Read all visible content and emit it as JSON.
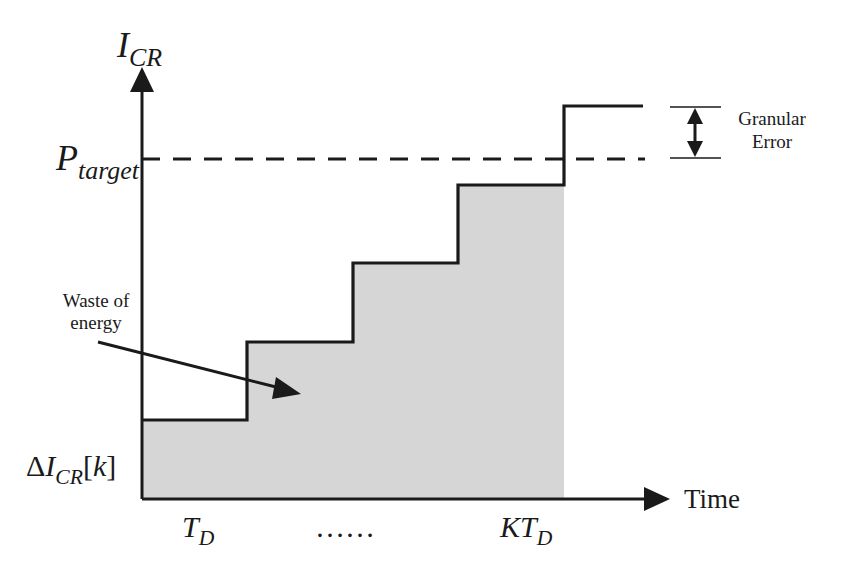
{
  "diagram": {
    "y_axis": {
      "symbol": "I",
      "subscript": "CR"
    },
    "x_axis": {
      "label": "Time"
    },
    "target_level": {
      "symbol": "P",
      "subscript": "target"
    },
    "initial_step": {
      "prefix": "Δ",
      "symbol": "I",
      "subscript": "CR",
      "suffix": "[",
      "index": "k",
      "close": "]"
    },
    "x_ticks": [
      {
        "symbol": "T",
        "subscript": "D"
      },
      {
        "text": "……"
      },
      {
        "symbol": "KT",
        "subscript": "D"
      }
    ],
    "annotations": {
      "waste": {
        "line1": "Waste of",
        "line2": "energy"
      },
      "granular": {
        "line1": "Granular",
        "line2": "Error"
      }
    },
    "steps": [
      {
        "x0": 142,
        "x1": 247,
        "y": 420
      },
      {
        "x0": 247,
        "x1": 353,
        "y": 342
      },
      {
        "x0": 353,
        "x1": 458,
        "y": 263
      },
      {
        "x0": 458,
        "x1": 564,
        "y": 185
      },
      {
        "x0": 564,
        "x1": 643,
        "y": 106
      }
    ],
    "colors": {
      "line": "#1a1a1a",
      "shade": "#d6d6d6",
      "background": "#ffffff"
    }
  }
}
